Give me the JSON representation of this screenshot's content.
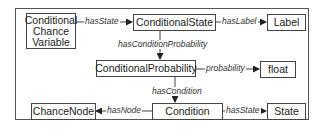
{
  "diagram": {
    "nodes": [
      {
        "id": "ccv",
        "label": "Conditional Chance Variable"
      },
      {
        "id": "cstate",
        "label": "ConditionalState"
      },
      {
        "id": "label",
        "label": "Label"
      },
      {
        "id": "cprob",
        "label": "ConditionalProbability"
      },
      {
        "id": "float",
        "label": "float"
      },
      {
        "id": "chancenode",
        "label": "ChanceNode"
      },
      {
        "id": "condition",
        "label": "Condition"
      },
      {
        "id": "state",
        "label": "State"
      }
    ],
    "ccv_lines": [
      "Conditional",
      "Chance",
      "Variable"
    ],
    "edges": [
      {
        "from": "ccv",
        "to": "cstate",
        "label": "hasState"
      },
      {
        "from": "cstate",
        "to": "label",
        "label": "hasLabel"
      },
      {
        "from": "cstate",
        "to": "cprob",
        "label": "hasConditionProbability"
      },
      {
        "from": "cprob",
        "to": "float",
        "label": "probability"
      },
      {
        "from": "cprob",
        "to": "condition",
        "label": "hasCondition"
      },
      {
        "from": "condition",
        "to": "chancenode",
        "label": "hasNode"
      },
      {
        "from": "condition",
        "to": "state",
        "label": "hasState"
      }
    ],
    "colors": {
      "line": "#444444",
      "text": "#222222",
      "background": "#ffffff"
    }
  }
}
